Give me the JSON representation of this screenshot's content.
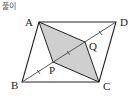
{
  "header": {
    "label": "풀이"
  },
  "figure": {
    "type": "parallelogram-diagram",
    "colors": {
      "stroke": "#222222",
      "shade": "#cfcfcf",
      "diagonal": "#444444"
    },
    "vertices": {
      "A": {
        "label": "A",
        "x": 39,
        "y": 22,
        "lx": 25,
        "ly": 26
      },
      "D": {
        "label": "D",
        "x": 116,
        "y": 22,
        "lx": 120,
        "ly": 26
      },
      "B": {
        "label": "B",
        "x": 22,
        "y": 82,
        "lx": 11,
        "ly": 89
      },
      "C": {
        "label": "C",
        "x": 99,
        "y": 82,
        "lx": 103,
        "ly": 90
      },
      "P": {
        "label": "P",
        "x": 53,
        "y": 62,
        "lx": 49,
        "ly": 74
      },
      "Q": {
        "label": "Q",
        "x": 85,
        "y": 42,
        "lx": 89,
        "ly": 50
      }
    },
    "shaded_region": "APCQ",
    "diagonal": "BD",
    "equal_segment_marks": 3
  }
}
